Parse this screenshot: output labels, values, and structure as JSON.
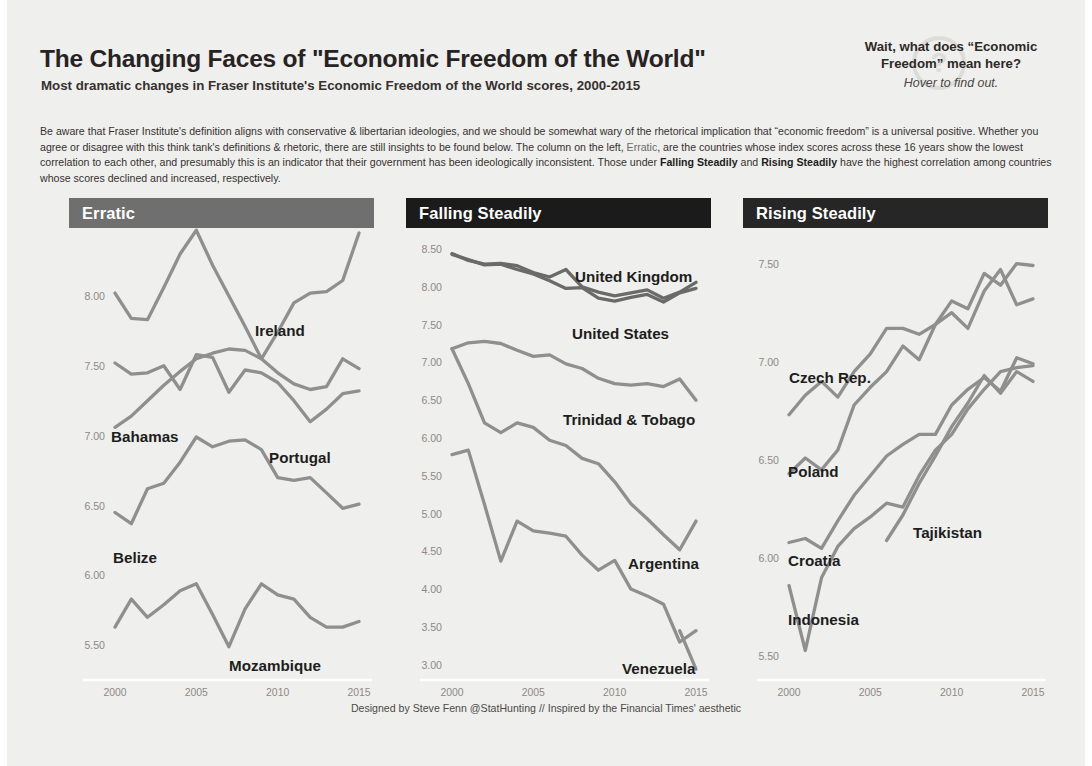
{
  "header": {
    "title": "The Changing Faces of \"Economic Freedom of the World\"",
    "subtitle": "Most dramatic changes in Fraser Institute's Economic Freedom of the World scores, 2000-2015",
    "help_line1": "Wait, what does “Economic",
    "help_line2": "Freedom” mean here?",
    "help_line3": "Hover to find out.",
    "help_icon": "question-mark"
  },
  "description": {
    "part1": "Be aware that Fraser Institute's definition aligns with conservative & libertarian ideologies, and we should be somewhat wary of the rhetorical implication that “economic freedom” is a universal positive. Whether you agree or disagree with this think tank's definitions & rhetoric, there are still insights to be found below. The column on the left, ",
    "emph_erratic": "Erratic",
    "part2": ", are the countries whose index scores across these 16 years show the lowest correlation to each other, and presumably this is an indicator that their government has been ideologically inconsistent. Those under ",
    "emph_falling": "Falling Steadily",
    "part3": " and ",
    "emph_rising": "Rising Steadily",
    "part4": " have the highest correlation among countries whose scores declined and increased, respectively."
  },
  "footer": {
    "credit": "Designed by Steve Fenn @StatHunting // Inspired by the Financial Times' aesthetic"
  },
  "colors": {
    "background": "#efefed",
    "band_erratic": "#6f6f6f",
    "band_falling": "#1b1b1b",
    "band_rising": "#262626",
    "line": "#8f8f8f",
    "line_dark": "#6a6a6a",
    "tick_text": "#8e8a86"
  },
  "chart_data": [
    {
      "type": "line",
      "panel": "Erratic",
      "band_color": "#6f6f6f",
      "title": "Erratic",
      "xlabel": "",
      "ylabel": "",
      "x": [
        2000,
        2001,
        2002,
        2003,
        2004,
        2005,
        2006,
        2007,
        2008,
        2009,
        2010,
        2011,
        2012,
        2013,
        2014,
        2015
      ],
      "xticks": [
        2000,
        2005,
        2010,
        2015
      ],
      "yticks": [
        8.0,
        7.5,
        7.0,
        6.5,
        6.0,
        5.5
      ],
      "ytick_labels": [
        "8.00",
        "7.50",
        "7.00",
        "6.50",
        "6.00",
        "5.50"
      ],
      "ylim": [
        5.28,
        8.4
      ],
      "grid": false,
      "legend": "inline-labels",
      "series": [
        {
          "name": "Ireland",
          "values": [
            8.02,
            7.84,
            7.83,
            8.06,
            8.3,
            8.47,
            8.22,
            8.0,
            7.78,
            7.55,
            7.74,
            7.95,
            8.02,
            8.03,
            8.11,
            8.45
          ]
        },
        {
          "name": "Bahamas",
          "values": [
            7.52,
            7.44,
            7.45,
            7.5,
            7.33,
            7.58,
            7.56,
            7.31,
            7.47,
            7.45,
            7.38,
            7.25,
            7.1,
            7.19,
            7.3,
            7.32
          ]
        },
        {
          "name": "Portugal",
          "values": [
            7.06,
            7.14,
            7.25,
            7.36,
            7.46,
            7.55,
            7.59,
            7.62,
            7.61,
            7.55,
            7.45,
            7.37,
            7.33,
            7.35,
            7.55,
            7.48
          ]
        },
        {
          "name": "Belize",
          "values": [
            6.45,
            6.37,
            6.62,
            6.66,
            6.81,
            6.99,
            6.92,
            6.96,
            6.97,
            6.9,
            6.7,
            6.68,
            6.7,
            6.59,
            6.48,
            6.51
          ]
        },
        {
          "name": "Mozambique",
          "values": [
            5.63,
            5.83,
            5.7,
            5.79,
            5.89,
            5.94,
            5.72,
            5.49,
            5.76,
            5.94,
            5.86,
            5.83,
            5.7,
            5.63,
            5.63,
            5.67
          ]
        }
      ],
      "labels": [
        {
          "text": "Ireland",
          "x": 248,
          "y": 322
        },
        {
          "text": "Bahamas",
          "x": 104,
          "y": 428
        },
        {
          "text": "Portugal",
          "x": 262,
          "y": 449
        },
        {
          "text": "Belize",
          "x": 106,
          "y": 549
        },
        {
          "text": "Mozambique",
          "x": 222,
          "y": 657
        }
      ]
    },
    {
      "type": "line",
      "panel": "Falling Steadily",
      "band_color": "#1b1b1b",
      "title": "Falling Steadily",
      "xlabel": "",
      "ylabel": "",
      "x": [
        2000,
        2001,
        2002,
        2003,
        2004,
        2005,
        2006,
        2007,
        2008,
        2009,
        2010,
        2011,
        2012,
        2013,
        2014,
        2015
      ],
      "xticks": [
        2000,
        2005,
        2010,
        2015
      ],
      "yticks": [
        8.5,
        8.0,
        7.5,
        7.0,
        6.5,
        6.0,
        5.5,
        5.0,
        4.5,
        4.0,
        3.5,
        3.0
      ],
      "ytick_labels": [
        "8.50",
        "8.00",
        "7.50",
        "7.00",
        "6.50",
        "6.00",
        "5.50",
        "5.00",
        "4.50",
        "4.00",
        "3.50",
        "3.00"
      ],
      "ylim": [
        2.85,
        8.62
      ],
      "grid": false,
      "legend": "inline-labels",
      "series": [
        {
          "name": "United Kingdom",
          "values": [
            8.44,
            8.35,
            8.3,
            8.31,
            8.28,
            8.19,
            8.13,
            8.23,
            8.0,
            7.93,
            7.88,
            7.92,
            7.96,
            7.85,
            7.93,
            8.06
          ]
        },
        {
          "name": "United States",
          "values": [
            8.43,
            8.36,
            8.29,
            8.3,
            8.23,
            8.17,
            8.08,
            7.98,
            7.99,
            7.85,
            7.81,
            7.86,
            7.9,
            7.8,
            7.92,
            7.98
          ]
        },
        {
          "name": "Trinidad & Tobago",
          "values": [
            7.18,
            7.26,
            7.28,
            7.25,
            7.16,
            7.08,
            7.1,
            6.98,
            6.92,
            6.79,
            6.72,
            6.7,
            6.72,
            6.68,
            6.78,
            6.5
          ]
        },
        {
          "name": "Argentina",
          "values": [
            7.18,
            6.72,
            6.2,
            6.07,
            6.2,
            6.14,
            5.97,
            5.9,
            5.73,
            5.66,
            5.42,
            5.13,
            4.93,
            4.72,
            4.52,
            4.9
          ]
        },
        {
          "name": "Venezuela",
          "values": [
            5.78,
            5.84,
            5.12,
            4.37,
            4.9,
            4.77,
            4.74,
            4.7,
            4.45,
            4.25,
            4.38,
            4.0,
            3.91,
            3.8,
            3.3,
            3.45
          ]
        },
        {
          "name": "Venezuela_tail",
          "values": [
            3.45,
            2.94
          ]
        }
      ],
      "labels": [
        {
          "text": "United Kingdom",
          "x": 568,
          "y": 268
        },
        {
          "text": "United States",
          "x": 565,
          "y": 325
        },
        {
          "text": "Trinidad & Tobago",
          "x": 556,
          "y": 411
        },
        {
          "text": "Argentina",
          "x": 621,
          "y": 555
        },
        {
          "text": "Venezuela",
          "x": 615,
          "y": 660
        }
      ]
    },
    {
      "type": "line",
      "panel": "Rising Steadily",
      "band_color": "#262626",
      "title": "Rising Steadily",
      "xlabel": "",
      "ylabel": "",
      "x": [
        2000,
        2001,
        2002,
        2003,
        2004,
        2005,
        2006,
        2007,
        2008,
        2009,
        2010,
        2011,
        2012,
        2013,
        2014,
        2015
      ],
      "xticks": [
        2000,
        2005,
        2010,
        2015
      ],
      "yticks": [
        7.5,
        7.0,
        6.5,
        6.0,
        5.5
      ],
      "ytick_labels": [
        "7.50",
        "7.00",
        "6.50",
        "6.00",
        "5.50"
      ],
      "ylim": [
        5.4,
        7.62
      ],
      "grid": false,
      "legend": "inline-labels",
      "series": [
        {
          "name": "Czech Rep.",
          "values": [
            6.73,
            6.83,
            6.9,
            6.82,
            6.95,
            7.04,
            7.17,
            7.17,
            7.14,
            7.19,
            7.31,
            7.27,
            7.45,
            7.39,
            7.5,
            7.49
          ]
        },
        {
          "name": "Poland",
          "values": [
            6.43,
            6.51,
            6.45,
            6.55,
            6.78,
            6.87,
            6.95,
            7.08,
            7.01,
            7.19,
            7.25,
            7.17,
            7.36,
            7.47,
            7.29,
            7.32
          ]
        },
        {
          "name": "Croatia",
          "values": [
            6.08,
            6.1,
            6.05,
            6.19,
            6.32,
            6.42,
            6.52,
            6.58,
            6.63,
            6.63,
            6.78,
            6.86,
            6.92,
            6.85,
            7.02,
            6.99
          ]
        },
        {
          "name": "Indonesia",
          "values": [
            5.86,
            5.53,
            5.9,
            6.06,
            6.15,
            6.21,
            6.28,
            6.26,
            6.42,
            6.55,
            6.63,
            6.76,
            6.86,
            6.95,
            6.97,
            6.98
          ]
        },
        {
          "name": "Tajikistan",
          "values": [
            6.09,
            6.22,
            6.38,
            6.52,
            6.67,
            6.79,
            6.93,
            6.84,
            6.95,
            6.9
          ]
        }
      ],
      "labels": [
        {
          "text": "Czech Rep.",
          "x": 782,
          "y": 369
        },
        {
          "text": "Poland",
          "x": 781,
          "y": 463
        },
        {
          "text": "Croatia",
          "x": 781,
          "y": 552
        },
        {
          "text": "Indonesia",
          "x": 781,
          "y": 611
        },
        {
          "text": "Tajikistan",
          "x": 906,
          "y": 524
        }
      ]
    }
  ]
}
